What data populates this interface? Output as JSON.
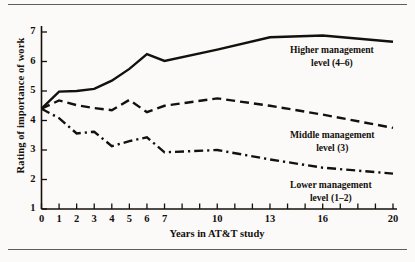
{
  "figure": {
    "background_color": "#fbfaf8",
    "ink_color": "#14100c",
    "rule_color": "#5d5d5d"
  },
  "chart_data": {
    "type": "line",
    "title": "",
    "xlabel": "Years in AT&T study",
    "ylabel": "Rating of importance of work",
    "xlim": [
      0,
      20
    ],
    "ylim": [
      1,
      7
    ],
    "grid": false,
    "legend_position": "inline-right-of-series",
    "x_tick_values": [
      0,
      1,
      2,
      3,
      4,
      5,
      6,
      7,
      8,
      9,
      10,
      11,
      12,
      13,
      14,
      15,
      16,
      17,
      18,
      19,
      20
    ],
    "x_tick_labels": [
      "0",
      "1",
      "2",
      "3",
      "4",
      "5",
      "6",
      "7",
      "",
      "",
      "10",
      "",
      "",
      "13",
      "",
      "",
      "16",
      "",
      "",
      "",
      "20"
    ],
    "y_tick_values": [
      1,
      2,
      3,
      4,
      5,
      6,
      7
    ],
    "y_tick_labels": [
      "1",
      "2",
      "3",
      "4",
      "5",
      "6",
      "7"
    ],
    "x": [
      0,
      1,
      2,
      3,
      4,
      5,
      6,
      7,
      10,
      13,
      16,
      20
    ],
    "series": [
      {
        "name": "Higher management level (4–6)",
        "label_line1": "Higher management",
        "label_line2": "level (4–6)",
        "style": "solid",
        "color": "#14100c",
        "values": [
          4.4,
          4.98,
          5.0,
          5.07,
          5.35,
          5.75,
          6.25,
          6.02,
          6.4,
          6.82,
          6.88,
          6.67
        ]
      },
      {
        "name": "Middle management level (3)",
        "label_line1": "Middle management",
        "label_line2": "level (3)",
        "style": "dashed",
        "color": "#14100c",
        "values": [
          4.4,
          4.68,
          4.52,
          4.42,
          4.35,
          4.7,
          4.28,
          4.5,
          4.75,
          4.5,
          4.2,
          3.75
        ]
      },
      {
        "name": "Lower management level (1–2)",
        "label_line1": "Lower management",
        "label_line2": "level (1–2)",
        "style": "dashdot",
        "color": "#14100c",
        "values": [
          4.4,
          4.08,
          3.56,
          3.62,
          3.13,
          3.3,
          3.43,
          2.92,
          3.0,
          2.68,
          2.4,
          2.2
        ]
      }
    ],
    "annotations": [
      {
        "text": "Higher management level (4–6)",
        "near_x": 16,
        "near_y": 6.4
      },
      {
        "text": "Middle management level (3)",
        "near_x": 16,
        "near_y": 3.3
      },
      {
        "text": "Lower management level (1–2)",
        "near_x": 16,
        "near_y": 1.9
      }
    ]
  }
}
